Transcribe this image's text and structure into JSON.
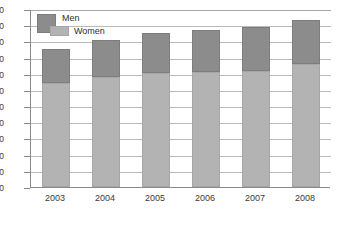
{
  "chart_data": {
    "type": "bar",
    "stacked": true,
    "title": "",
    "xlabel": "",
    "ylabel": "",
    "categories": [
      "2003",
      "2004",
      "2005",
      "2006",
      "2007",
      "2008"
    ],
    "series": [
      {
        "name": "Women",
        "color": "#b3b3b3",
        "values": [
          320,
          340,
          352,
          355,
          358,
          380
        ]
      },
      {
        "name": "Men",
        "color": "#8c8c8c",
        "values": [
          108,
          115,
          123,
          130,
          137,
          135
        ]
      }
    ],
    "totals": [
      428,
      455,
      475,
      485,
      495,
      515
    ],
    "ylim": [
      0,
      550
    ],
    "ytick_step": 50,
    "ytick_labels": [
      "550",
      "500",
      "450",
      "400",
      "350",
      "300",
      "250",
      "200",
      "150",
      "100",
      "50",
      "0"
    ],
    "ytick_values": [
      550,
      500,
      450,
      400,
      350,
      300,
      250,
      200,
      150,
      100,
      50,
      0
    ],
    "grid": true,
    "legend_position": "top-left",
    "legend": [
      {
        "label": "Men",
        "color": "#8c8c8c"
      },
      {
        "label": "Women",
        "color": "#b3b3b3"
      }
    ]
  }
}
